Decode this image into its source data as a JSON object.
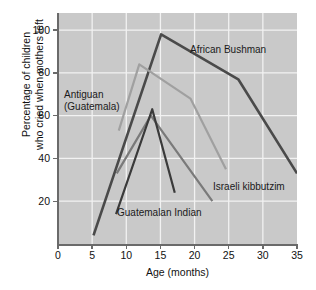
{
  "chart_data": {
    "type": "line",
    "title": "",
    "xlabel": "Age (months)",
    "ylabel": "Percentage of children who cried when mothers left",
    "ylabel_line1": "Percentage of children",
    "ylabel_line2": "who cried when mothers left",
    "xlim": [
      0,
      35
    ],
    "ylim": [
      0,
      108
    ],
    "xticks": [
      0,
      5,
      10,
      15,
      20,
      25,
      30,
      35
    ],
    "xtick_labels": [
      "0",
      "5",
      "10",
      "15",
      "20",
      "25",
      "30",
      "35"
    ],
    "yticks": [
      20,
      40,
      60,
      80,
      100
    ],
    "ytick_labels": [
      "20",
      "40",
      "60",
      "80",
      "100"
    ],
    "xgridlines": [
      5,
      10,
      15,
      20,
      25,
      30
    ],
    "ygridlines": [
      20,
      40,
      60,
      80,
      100
    ],
    "grid": true,
    "legend": "annotations",
    "plot_background": "#c9c9c9",
    "grid_color": "#f2f2f2",
    "series": [
      {
        "name": "African Bushman",
        "color": "#4a4a4a",
        "width": 2.6,
        "x": [
          5.2,
          15.1,
          26.4,
          35.0
        ],
        "y": [
          4,
          98,
          77,
          33
        ]
      },
      {
        "name": "Antiguan (Guatemala)",
        "color": "#a0a0a0",
        "width": 2.2,
        "x": [
          8.9,
          11.9,
          19.4,
          24.6
        ],
        "y": [
          53,
          84,
          68,
          35
        ]
      },
      {
        "name": "Israeli kibbutzim",
        "color": "#7a7a7a",
        "width": 2.2,
        "x": [
          8.6,
          13.6,
          22.6
        ],
        "y": [
          33,
          60,
          20
        ]
      },
      {
        "name": "Guatemalan Indian",
        "color": "#3a3a3a",
        "width": 2.2,
        "x": [
          8.5,
          13.8,
          17.1
        ],
        "y": [
          14,
          63,
          24
        ]
      }
    ],
    "annotations": [
      {
        "text": "African Bushman",
        "series": "African Bushman"
      },
      {
        "text_line1": "Antiguan",
        "text_line2": "(Guatemala)",
        "series": "Antiguan (Guatemala)"
      },
      {
        "text": "Israeli kibbutzim",
        "series": "Israeli kibbutzim"
      },
      {
        "text": "Guatemalan Indian",
        "series": "Guatemalan Indian"
      }
    ]
  }
}
